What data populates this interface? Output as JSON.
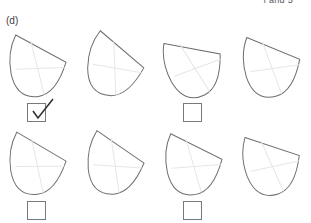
{
  "header": {
    "clipped_text": "f and 5"
  },
  "question": {
    "part_label": "(d)"
  },
  "colors": {
    "outline": "#6b6e73",
    "grid_line": "#e6e6ea",
    "checkbox_border": "#76797d",
    "checkmark": "#2f3135",
    "text": "#3c3c3c",
    "background": "#ffffff"
  },
  "options": [
    {
      "id": "option-1",
      "row": 1,
      "column": 1,
      "shape_name": "curved-quadrilateral-tile",
      "rotation_deg": -8,
      "checked": true,
      "checkbox_label": ""
    },
    {
      "id": "option-2",
      "row": 1,
      "column": 2,
      "shape_name": "curved-quadrilateral-tile",
      "rotation_deg": 4,
      "checked": false,
      "checkbox_label": ""
    },
    {
      "id": "option-3",
      "row": 1,
      "column": 3,
      "shape_name": "curved-quadrilateral-tile",
      "rotation_deg": -26,
      "checked": false,
      "checkbox_label": ""
    },
    {
      "id": "option-4",
      "row": 1,
      "column": 4,
      "shape_name": "curved-quadrilateral-tile",
      "rotation_deg": -14,
      "checked": false,
      "checkbox_label": ""
    },
    {
      "id": "option-5",
      "row": 2,
      "column": 1,
      "shape_name": "curved-quadrilateral-tile",
      "rotation_deg": -6,
      "checked": false,
      "checkbox_label": ""
    },
    {
      "id": "option-6",
      "row": 2,
      "column": 2,
      "shape_name": "curved-quadrilateral-tile",
      "rotation_deg": -2,
      "checked": false,
      "checkbox_label": ""
    },
    {
      "id": "option-7",
      "row": 2,
      "column": 3,
      "shape_name": "curved-quadrilateral-tile",
      "rotation_deg": -10,
      "checked": false,
      "checkbox_label": ""
    },
    {
      "id": "option-8",
      "row": 2,
      "column": 4,
      "shape_name": "curved-quadrilateral-tile",
      "rotation_deg": -18,
      "checked": false,
      "checkbox_label": ""
    }
  ]
}
